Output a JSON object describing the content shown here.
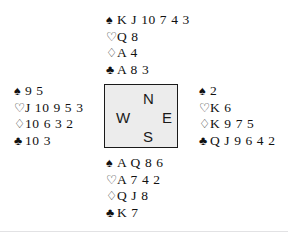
{
  "diagram": {
    "suit_symbols": {
      "spade": "♠",
      "heart": "♡",
      "diamond": "♢",
      "club": "♣"
    },
    "colors": {
      "ink": "#111111",
      "box_fill": "#ececec",
      "box_border": "#1a1a1a",
      "rule": "#e2e2e4"
    }
  },
  "compass": {
    "north": "N",
    "west": "W",
    "east": "E",
    "south": "S"
  },
  "hands": {
    "north": {
      "seat": "North",
      "spades": "K J 10 7 4 3",
      "hearts": "Q 8",
      "diamonds": "A 4",
      "clubs": "A 8 3"
    },
    "west": {
      "seat": "West",
      "spades": "9 5",
      "hearts": "J 10 9 5 3",
      "diamonds": "10 6 3 2",
      "clubs": "10 3"
    },
    "east": {
      "seat": "East",
      "spades": "2",
      "hearts": "K 6",
      "diamonds": "K 9 7 5",
      "clubs": "Q J 9 6 4 2"
    },
    "south": {
      "seat": "South",
      "spades": "A Q 8 6",
      "hearts": "A 7 4 2",
      "diamonds": "Q J 8",
      "clubs": "K 7"
    }
  }
}
